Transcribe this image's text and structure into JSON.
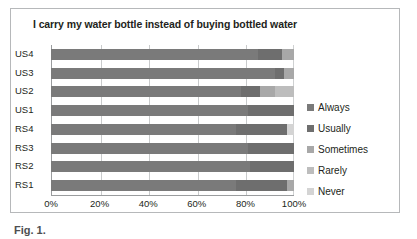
{
  "chart_data": {
    "type": "bar",
    "orientation": "horizontal",
    "stacked": true,
    "normalized_percent": true,
    "title": "I carry my water bottle instead of buying bottled water",
    "xlabel": "",
    "ylabel": "",
    "xlim": [
      0,
      100
    ],
    "xticks": [
      0,
      20,
      40,
      60,
      80,
      100
    ],
    "xticklabels": [
      "0%",
      "20%",
      "40%",
      "60%",
      "80%",
      "100%"
    ],
    "grid": true,
    "grid_axis": "x",
    "legend_position": "right",
    "categories": [
      "RS1",
      "RS2",
      "RS3",
      "RS4",
      "US1",
      "US2",
      "US3",
      "US4"
    ],
    "categories_top_to_bottom": [
      "US4",
      "US3",
      "US2",
      "US1",
      "RS4",
      "RS3",
      "RS2",
      "RS1"
    ],
    "series": [
      {
        "name": "Always",
        "color": "#7a7a7a",
        "values": [
          76,
          82,
          81,
          76,
          81,
          78,
          92,
          85
        ]
      },
      {
        "name": "Usually",
        "color": "#6e6e6e",
        "values": [
          21,
          18,
          19,
          21,
          19,
          8,
          4,
          10
        ]
      },
      {
        "name": "Sometimes",
        "color": "#a8a8a8",
        "values": [
          3,
          0,
          0,
          0,
          0,
          6,
          4,
          5
        ]
      },
      {
        "name": "Rarely",
        "color": "#bdbdbd",
        "values": [
          0,
          0,
          0,
          0,
          0,
          8,
          0,
          0
        ]
      },
      {
        "name": "Never",
        "color": "#d4d4d4",
        "values": [
          0,
          0,
          0,
          3,
          0,
          0,
          0,
          0
        ]
      }
    ]
  },
  "legend": {
    "items": [
      {
        "label": "Always",
        "color": "#7a7a7a"
      },
      {
        "label": "Usually",
        "color": "#6e6e6e"
      },
      {
        "label": "Sometimes",
        "color": "#a8a8a8"
      },
      {
        "label": "Rarely",
        "color": "#bdbdbd"
      },
      {
        "label": "Never",
        "color": "#d4d4d4"
      }
    ]
  },
  "caption": {
    "fragment": "Fig. 1."
  },
  "colors": {
    "frame_border": "#b6b8ba",
    "gridline": "#c9cbcc",
    "axis": "#9a9c9e",
    "text": "#231f20",
    "background": "#ffffff"
  }
}
